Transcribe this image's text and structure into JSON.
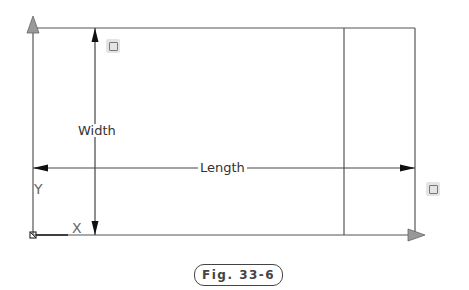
{
  "drawing": {
    "width_label": "Width",
    "length_label": "Length",
    "ucs_y_label": "Y",
    "ucs_x_label": "X",
    "colors": {
      "line": "#444444",
      "grip_arrow": "#999999"
    }
  },
  "caption": {
    "text": "Fig. 33-6"
  }
}
